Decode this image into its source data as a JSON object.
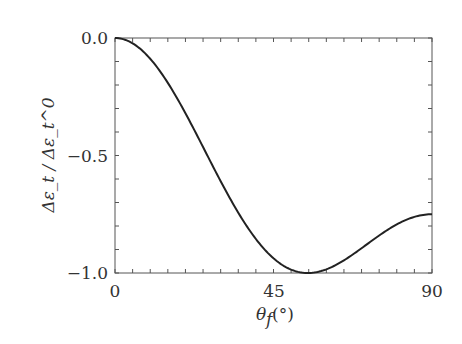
{
  "chart_data": {
    "type": "line",
    "title": "",
    "xlabel": "θ_f (°)",
    "ylabel": "Δε_t / Δε_t^0",
    "xlim": [
      0,
      90
    ],
    "ylim": [
      -1.0,
      0.0
    ],
    "xticks": [
      0,
      45,
      90
    ],
    "xtick_labels": [
      "0",
      "45",
      "90"
    ],
    "yticks": [
      0.0,
      -0.5,
      -1.0
    ],
    "ytick_labels": [
      "0.0",
      "-0.5",
      "-1.0"
    ],
    "x_minor_step": 5,
    "y_minor_step": 0.1,
    "grid": false,
    "legend": null,
    "series": [
      {
        "name": "Δε_t/Δε_t^0",
        "color": "#222222",
        "x": [
          0,
          5,
          10,
          15,
          20,
          25,
          30,
          35,
          40,
          45,
          50,
          54.7,
          60,
          65,
          70,
          75,
          80,
          85,
          90
        ],
        "y": [
          0.0,
          -0.022,
          -0.089,
          -0.188,
          -0.311,
          -0.449,
          -0.609,
          -0.766,
          -0.883,
          -0.938,
          -0.972,
          -1.0,
          -0.984,
          -0.941,
          -0.881,
          -0.823,
          -0.776,
          -0.752,
          -0.75
        ]
      }
    ]
  },
  "labels": {
    "x_axis": "θ",
    "x_axis_sub": "f",
    "x_axis_unit": "(°)",
    "y_axis": "Δε_t / Δε_t^0",
    "xtick_0": "0",
    "xtick_45": "45",
    "xtick_90": "90",
    "ytick_0": "0.0",
    "ytick_m05": "−0.5",
    "ytick_m1": "−1.0"
  }
}
